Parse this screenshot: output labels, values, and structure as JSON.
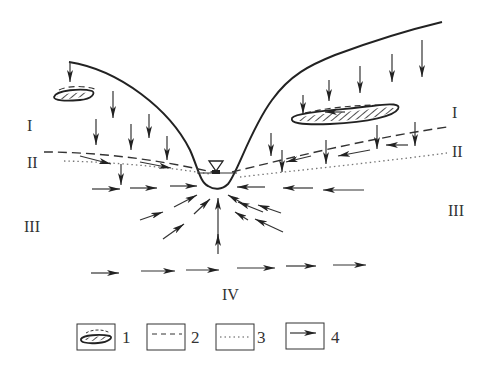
{
  "diagram": {
    "zones": [
      {
        "id": "I",
        "label": "I",
        "x": 33,
        "y": 131
      },
      {
        "id": "I-right",
        "label": "I",
        "x": 457,
        "y": 117
      },
      {
        "id": "II",
        "label": "II",
        "x": 33,
        "y": 167
      },
      {
        "id": "II-right",
        "label": "II",
        "x": 457,
        "y": 155
      },
      {
        "id": "III",
        "label": "III",
        "x": 33,
        "y": 232
      },
      {
        "id": "III-right",
        "label": "III",
        "x": 457,
        "y": 216
      },
      {
        "id": "IV",
        "label": "IV",
        "x": 234,
        "y": 300
      }
    ],
    "legend": [
      {
        "symbol": "perched-water-lens",
        "label": "1"
      },
      {
        "symbol": "dashed-line",
        "label": "2"
      },
      {
        "symbol": "dotted-line",
        "label": "3"
      },
      {
        "symbol": "flow-arrow",
        "label": "4"
      }
    ],
    "river_symbol": "water-level-triangle",
    "colors": {
      "line": "#222222",
      "dotted": "#777777",
      "background": "#ffffff"
    }
  }
}
